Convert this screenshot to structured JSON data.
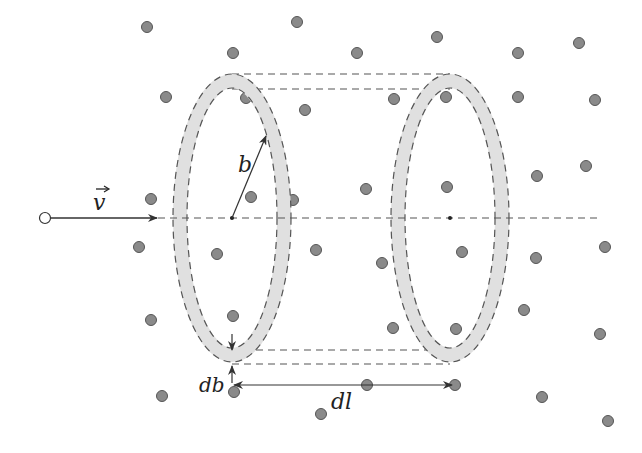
{
  "figure": {
    "labels": {
      "velocity": "v",
      "radius": "b",
      "thickness": "db",
      "length": "dl"
    },
    "colors": {
      "dot_fill": "#8a8a8a",
      "dot_stroke": "#555555",
      "ring_fill": "#e0e0e0",
      "line": "#333333",
      "dash": "#555555"
    },
    "axis": {
      "y": 218,
      "x_start": 45,
      "x_end": 600
    },
    "particle": {
      "x": 45,
      "y": 218
    },
    "left_ring": {
      "cx": 232,
      "cy": 218,
      "rx": 52,
      "ry": 137
    },
    "right_ring": {
      "cx": 450,
      "cy": 218,
      "rx": 52,
      "ry": 137
    },
    "dots": [
      [
        147,
        27
      ],
      [
        297,
        22
      ],
      [
        233,
        53
      ],
      [
        166,
        97
      ],
      [
        246,
        98
      ],
      [
        305,
        110
      ],
      [
        151,
        199
      ],
      [
        251,
        197
      ],
      [
        293,
        200
      ],
      [
        357,
        53
      ],
      [
        437,
        37
      ],
      [
        518,
        53
      ],
      [
        579,
        43
      ],
      [
        394,
        99
      ],
      [
        446,
        97
      ],
      [
        518,
        97
      ],
      [
        595,
        100
      ],
      [
        366,
        189
      ],
      [
        447,
        187
      ],
      [
        537,
        176
      ],
      [
        586,
        166
      ],
      [
        139,
        247
      ],
      [
        217,
        254
      ],
      [
        151,
        320
      ],
      [
        233,
        316
      ],
      [
        162,
        396
      ],
      [
        234,
        392
      ],
      [
        316,
        250
      ],
      [
        382,
        263
      ],
      [
        462,
        252
      ],
      [
        536,
        258
      ],
      [
        605,
        247
      ],
      [
        524,
        310
      ],
      [
        393,
        328
      ],
      [
        456,
        329
      ],
      [
        600,
        334
      ],
      [
        367,
        385
      ],
      [
        455,
        385
      ],
      [
        542,
        397
      ],
      [
        321,
        414
      ],
      [
        608,
        421
      ]
    ]
  }
}
